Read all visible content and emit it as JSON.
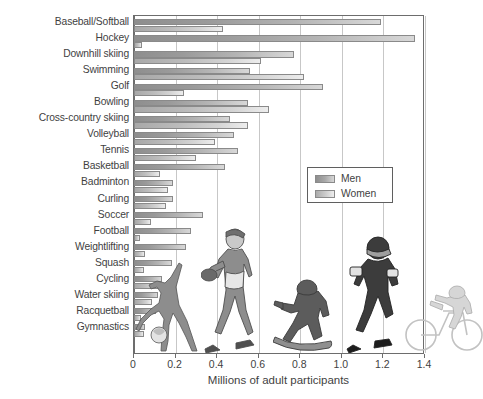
{
  "chart_data": {
    "type": "bar",
    "orientation": "horizontal",
    "title": "",
    "xlabel": "Millions of adult participants",
    "ylabel": "",
    "xlim": [
      0,
      1.4
    ],
    "xticks": [
      0,
      0.2,
      0.4,
      0.6,
      0.8,
      1.0,
      1.2,
      1.4
    ],
    "xticklabels": [
      "0",
      "0.2",
      "0.4",
      "0.6",
      "0.8",
      "1.0",
      "1.2",
      "1.4"
    ],
    "grid": "vertical",
    "legend_position": "center-right",
    "categories": [
      "Baseball/Softball",
      "Hockey",
      "Downhill skiing",
      "Swimming",
      "Golf",
      "Bowling",
      "Cross-country skiing",
      "Volleyball",
      "Tennis",
      "Basketball",
      "Badminton",
      "Curling",
      "Soccer",
      "Football",
      "Weightlifting",
      "Squash",
      "Cycling",
      "Water skiing",
      "Racquetball",
      "Gymnastics"
    ],
    "series": [
      {
        "name": "Men",
        "color": "#9a9a9a",
        "values": [
          1.19,
          1.35,
          0.77,
          0.56,
          0.91,
          0.55,
          0.46,
          0.48,
          0.5,
          0.44,
          0.19,
          0.19,
          0.33,
          0.275,
          0.25,
          0.185,
          0.135,
          0.115,
          0.105,
          0.055
        ]
      },
      {
        "name": "Women",
        "color": "#cdcdcd",
        "values": [
          0.43,
          0.04,
          0.61,
          0.82,
          0.24,
          0.65,
          0.55,
          0.39,
          0.3,
          0.125,
          0.165,
          0.155,
          0.08,
          0.03,
          0.055,
          0.05,
          0.12,
          0.085,
          0.035,
          0.05
        ]
      }
    ]
  },
  "legend": {
    "items": [
      {
        "label": "Men"
      },
      {
        "label": "Women"
      }
    ]
  },
  "axis": {
    "x_title": "Millions of adult participants"
  },
  "figures": [
    {
      "name": "gymnast-figure"
    },
    {
      "name": "baseball-player-figure"
    },
    {
      "name": "snowboarder-figure"
    },
    {
      "name": "football-player-figure"
    },
    {
      "name": "cyclist-figure"
    }
  ]
}
